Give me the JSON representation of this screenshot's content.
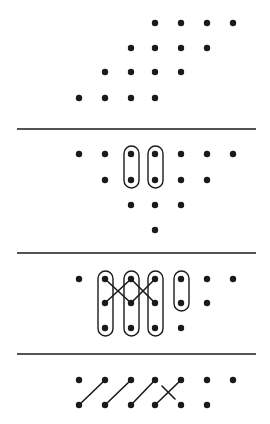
{
  "diagram": {
    "colors": {
      "ink": "#1a1a1a",
      "background": "#ffffff"
    },
    "dot_radius": 3.2,
    "panels": [
      {
        "id": "panel-1",
        "dots": [
          [
            155,
            23
          ],
          [
            181,
            23
          ],
          [
            207,
            23
          ],
          [
            233,
            23
          ],
          [
            131,
            48
          ],
          [
            155,
            48
          ],
          [
            181,
            48
          ],
          [
            207,
            48
          ],
          [
            105,
            72
          ],
          [
            131,
            72
          ],
          [
            155,
            72
          ],
          [
            181,
            72
          ],
          [
            79,
            98
          ],
          [
            105,
            98
          ],
          [
            131,
            98
          ],
          [
            155,
            98
          ]
        ],
        "ovals": [],
        "lines": []
      },
      {
        "id": "panel-2",
        "divider_y": 129,
        "dots": [
          [
            79,
            154
          ],
          [
            105,
            154
          ],
          [
            131,
            154
          ],
          [
            155,
            154
          ],
          [
            181,
            154
          ],
          [
            207,
            154
          ],
          [
            233,
            154
          ],
          [
            105,
            180
          ],
          [
            131,
            180
          ],
          [
            155,
            180
          ],
          [
            181,
            180
          ],
          [
            207,
            180
          ],
          [
            131,
            205
          ],
          [
            155,
            205
          ],
          [
            181,
            205
          ],
          [
            155,
            230
          ]
        ],
        "ovals": [
          {
            "x": 124,
            "y": 146,
            "w": 15,
            "h": 42
          },
          {
            "x": 148,
            "y": 146,
            "w": 15,
            "h": 42
          }
        ],
        "lines": []
      },
      {
        "id": "panel-3",
        "divider_y": 253,
        "dots": [
          [
            79,
            279
          ],
          [
            105,
            279
          ],
          [
            131,
            279
          ],
          [
            155,
            279
          ],
          [
            181,
            279
          ],
          [
            207,
            279
          ],
          [
            233,
            279
          ],
          [
            105,
            303
          ],
          [
            131,
            303
          ],
          [
            155,
            303
          ],
          [
            181,
            303
          ],
          [
            207,
            303
          ],
          [
            105,
            328
          ],
          [
            131,
            328
          ],
          [
            155,
            328
          ],
          [
            181,
            328
          ]
        ],
        "ovals": [
          {
            "x": 98,
            "y": 271,
            "w": 15,
            "h": 65
          },
          {
            "x": 124,
            "y": 271,
            "w": 15,
            "h": 65
          },
          {
            "x": 148,
            "y": 271,
            "w": 15,
            "h": 65
          },
          {
            "x": 174,
            "y": 271,
            "w": 15,
            "h": 40
          }
        ],
        "lines": [
          [
            105,
            279,
            131,
            303
          ],
          [
            105,
            303,
            131,
            279
          ],
          [
            131,
            279,
            155,
            303
          ],
          [
            131,
            303,
            155,
            279
          ]
        ]
      },
      {
        "id": "panel-4",
        "divider_y": 354,
        "dots": [
          [
            79,
            380
          ],
          [
            105,
            380
          ],
          [
            131,
            380
          ],
          [
            155,
            380
          ],
          [
            181,
            380
          ],
          [
            207,
            380
          ],
          [
            233,
            380
          ],
          [
            79,
            405
          ],
          [
            105,
            405
          ],
          [
            131,
            405
          ],
          [
            155,
            405
          ],
          [
            181,
            405
          ],
          [
            207,
            405
          ]
        ],
        "ovals": [],
        "lines": [
          [
            79,
            405,
            105,
            380
          ],
          [
            105,
            405,
            131,
            380
          ],
          [
            131,
            405,
            155,
            380
          ],
          [
            155,
            405,
            181,
            380
          ],
          [
            162,
            386,
            175,
            399
          ]
        ]
      }
    ],
    "divider": {
      "x1": 17,
      "x2": 256
    }
  }
}
